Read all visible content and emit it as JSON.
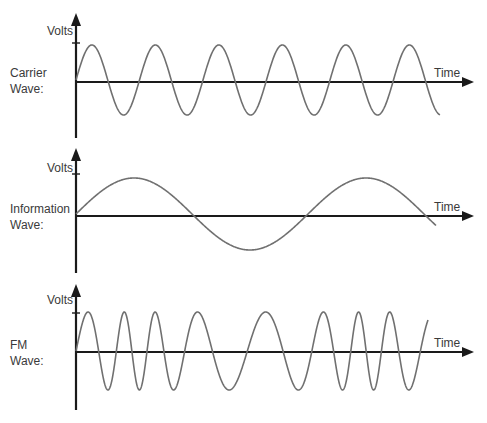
{
  "diagram": {
    "title": "",
    "axis_labels": {
      "y": "Volts",
      "x": "Time"
    },
    "colors": {
      "axis": "#1a1a1a",
      "wave": "#707070",
      "text": "#3a3a3a"
    },
    "panels": [
      {
        "id": "carrier",
        "label_line1": "Carrier",
        "label_line2": "Wave:",
        "y_label": "Volts",
        "x_label": "Time",
        "description": "Constant-frequency sine wave, ~5.75 cycles"
      },
      {
        "id": "information",
        "label_line1": "Information",
        "label_line2": "Wave:",
        "y_label": "Volts",
        "x_label": "Time",
        "description": "Low-frequency sine wave, ~1.55 cycles"
      },
      {
        "id": "fm",
        "label_line1": "FM",
        "label_line2": "Wave:",
        "y_label": "Volts",
        "x_label": "Time",
        "description": "Frequency-modulated wave: frequency highest where information wave is lowest, lowest where information wave peaks"
      }
    ]
  }
}
